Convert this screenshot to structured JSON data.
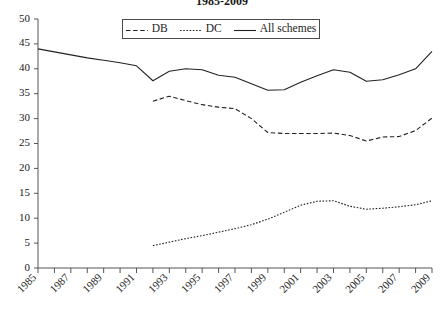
{
  "chart_data": {
    "type": "line",
    "title": "1985-2009",
    "xlabel": "",
    "ylabel": "",
    "xlim": [
      1985,
      2009
    ],
    "ylim": [
      0,
      50
    ],
    "y_ticks": [
      0,
      5,
      10,
      15,
      20,
      25,
      30,
      35,
      40,
      45,
      50
    ],
    "x_ticks": [
      1985,
      1986,
      1987,
      1988,
      1989,
      1990,
      1991,
      1992,
      1993,
      1994,
      1995,
      1996,
      1997,
      1998,
      1999,
      2000,
      2001,
      2002,
      2003,
      2004,
      2005,
      2006,
      2007,
      2008,
      2009
    ],
    "x_tick_labels": [
      "1985",
      "",
      "1987",
      "",
      "1989",
      "",
      "1991",
      "",
      "1993",
      "",
      "1995",
      "",
      "1997",
      "",
      "1999",
      "",
      "2001",
      "",
      "2003",
      "",
      "2005",
      "",
      "2007",
      "",
      "2009"
    ],
    "grid": false,
    "legend_position": "top-center",
    "x": [
      1985,
      1986,
      1987,
      1988,
      1989,
      1990,
      1991,
      1992,
      1993,
      1994,
      1995,
      1996,
      1997,
      1998,
      1999,
      2000,
      2001,
      2002,
      2003,
      2004,
      2005,
      2006,
      2007,
      2008,
      2009
    ],
    "series": [
      {
        "name": "DB",
        "style": "dashed",
        "x": [
          1992,
          1993,
          1994,
          1995,
          1996,
          1997,
          1998,
          1999,
          2000,
          2001,
          2002,
          2003,
          2004,
          2005,
          2006,
          2007,
          2008,
          2009
        ],
        "values": [
          33.5,
          34.5,
          33.6,
          32.8,
          32.3,
          32.0,
          30.0,
          27.2,
          27.0,
          27.0,
          27.0,
          27.1,
          26.6,
          25.5,
          26.3,
          26.4,
          27.6,
          30.1
        ]
      },
      {
        "name": "DC",
        "style": "dotted",
        "x": [
          1992,
          1993,
          1994,
          1995,
          1996,
          1997,
          1998,
          1999,
          2000,
          2001,
          2002,
          2003,
          2004,
          2005,
          2006,
          2007,
          2008,
          2009
        ],
        "values": [
          4.5,
          5.2,
          5.9,
          6.5,
          7.2,
          7.9,
          8.7,
          9.8,
          11.2,
          12.6,
          13.4,
          13.5,
          12.4,
          11.8,
          12.0,
          12.3,
          12.7,
          13.5
        ]
      },
      {
        "name": "All schemes",
        "style": "solid",
        "x": [
          1985,
          1986,
          1987,
          1988,
          1989,
          1990,
          1991,
          1992,
          1993,
          1994,
          1995,
          1996,
          1997,
          1998,
          1999,
          2000,
          2001,
          2002,
          2003,
          2004,
          2005,
          2006,
          2007,
          2008,
          2009
        ],
        "values": [
          44.0,
          43.4,
          42.8,
          42.2,
          41.7,
          41.2,
          40.6,
          37.6,
          39.5,
          40.0,
          39.8,
          38.7,
          38.3,
          37.0,
          35.7,
          35.8,
          37.3,
          38.6,
          39.8,
          39.3,
          37.5,
          37.8,
          38.8,
          40.0,
          43.5
        ]
      }
    ]
  },
  "legend": {
    "items": [
      {
        "label": "DB",
        "swatch": "dashed-line-swatch"
      },
      {
        "label": "DC",
        "swatch": "dotted-line-swatch"
      },
      {
        "label": "All schemes",
        "swatch": "solid-line-swatch"
      }
    ]
  }
}
